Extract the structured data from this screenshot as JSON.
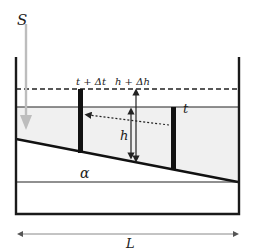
{
  "diagram": {
    "labels": {
      "source": "S",
      "time_later": "t + Δt",
      "depth_later": "h + Δh",
      "time_now": "t",
      "depth": "h",
      "angle": "α",
      "length": "L"
    },
    "colors": {
      "water_fill": "#f0f0f0",
      "wall": "#1a1a1a",
      "source_arrow": "#bdbdbd",
      "dimension_arrow": "#777777"
    }
  }
}
